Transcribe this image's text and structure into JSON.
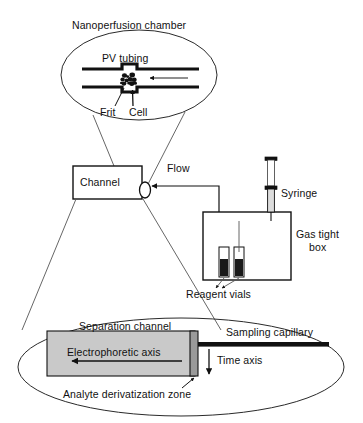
{
  "figure": {
    "colors": {
      "stroke": "#111111",
      "thin_stroke": "#3a3a3a",
      "channel_fill": "#c9c9c9",
      "derivatization_fill": "#9a9a9a",
      "vial_liquid": "#1a1a1a",
      "background": "#ffffff"
    }
  },
  "top_detail": {
    "title": "Nanoperfusion chamber",
    "tubing_label": "PV tubing",
    "frit_label": "Frit",
    "cell_label": "Cell"
  },
  "middle": {
    "channel_label": "Channel",
    "flow_label": "Flow",
    "syringe_label": "Syringe",
    "gas_tight_box_label_line1": "Gas tight",
    "gas_tight_box_label_line2": "box",
    "reagent_vials_label": "Reagent vials"
  },
  "bottom_detail": {
    "separation_channel_label": "Separation channel",
    "electrophoretic_axis_label": "Electrophoretic axis",
    "analyte_zone_label": "Analyte derivatization zone",
    "sampling_capillary_label": "Sampling capillary",
    "time_axis_label": "Time axis"
  }
}
